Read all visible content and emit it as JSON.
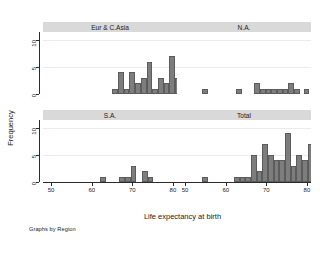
{
  "chart_data": {
    "type": "bar",
    "title": "",
    "xlabel": "Life expectancy at birth",
    "ylabel": "Frequency",
    "note": "Graphs by Region",
    "xlim": [
      48,
      81
    ],
    "ylim": [
      0,
      11.5
    ],
    "xticks": [
      50,
      60,
      70,
      80
    ],
    "yticks": [
      0,
      5,
      10
    ],
    "grid": true,
    "bar_color": "#7d7d7d",
    "bar_edge_color": "#5c5c5c",
    "panel_header_color": "#d9d9d9",
    "bin_width": 1.4,
    "panels": [
      {
        "label": "Eur & C.Asia",
        "row": 0,
        "col": 0,
        "bins": [
          {
            "x": 65.1,
            "freq": 1
          },
          {
            "x": 66.5,
            "freq": 4
          },
          {
            "x": 67.9,
            "freq": 1
          },
          {
            "x": 69.3,
            "freq": 4
          },
          {
            "x": 70.7,
            "freq": 2
          },
          {
            "x": 72.1,
            "freq": 3
          },
          {
            "x": 73.5,
            "freq": 6
          },
          {
            "x": 74.9,
            "freq": 1
          },
          {
            "x": 76.3,
            "freq": 3
          },
          {
            "x": 77.7,
            "freq": 2
          },
          {
            "x": 79.1,
            "freq": 7
          },
          {
            "x": 80.5,
            "freq": 3
          }
        ]
      },
      {
        "label": "N.A.",
        "row": 0,
        "col": 1,
        "bins": [
          {
            "x": 54.2,
            "freq": 1
          },
          {
            "x": 62.6,
            "freq": 1
          },
          {
            "x": 67.0,
            "freq": 2
          },
          {
            "x": 68.4,
            "freq": 1
          },
          {
            "x": 69.8,
            "freq": 1
          },
          {
            "x": 71.2,
            "freq": 1
          },
          {
            "x": 72.6,
            "freq": 1
          },
          {
            "x": 74.0,
            "freq": 1
          },
          {
            "x": 75.4,
            "freq": 2
          },
          {
            "x": 76.8,
            "freq": 1
          },
          {
            "x": 79.2,
            "freq": 1
          }
        ]
      },
      {
        "label": "S.A.",
        "row": 1,
        "col": 0,
        "bins": [
          {
            "x": 62.0,
            "freq": 1
          },
          {
            "x": 66.8,
            "freq": 1
          },
          {
            "x": 68.2,
            "freq": 1
          },
          {
            "x": 69.6,
            "freq": 3
          },
          {
            "x": 72.4,
            "freq": 2
          },
          {
            "x": 73.8,
            "freq": 1
          }
        ]
      },
      {
        "label": "Total",
        "row": 1,
        "col": 1,
        "bins": [
          {
            "x": 54.2,
            "freq": 1
          },
          {
            "x": 62.0,
            "freq": 1
          },
          {
            "x": 63.4,
            "freq": 1
          },
          {
            "x": 64.8,
            "freq": 1
          },
          {
            "x": 66.2,
            "freq": 5
          },
          {
            "x": 67.6,
            "freq": 2
          },
          {
            "x": 69.0,
            "freq": 7
          },
          {
            "x": 70.4,
            "freq": 5
          },
          {
            "x": 71.8,
            "freq": 4
          },
          {
            "x": 73.2,
            "freq": 4
          },
          {
            "x": 74.6,
            "freq": 9
          },
          {
            "x": 76.0,
            "freq": 3
          },
          {
            "x": 77.4,
            "freq": 5
          },
          {
            "x": 78.8,
            "freq": 4
          },
          {
            "x": 80.2,
            "freq": 7
          },
          {
            "x": 81.6,
            "freq": 4
          }
        ]
      }
    ]
  }
}
